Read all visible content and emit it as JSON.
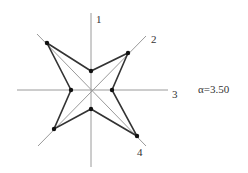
{
  "diagram": {
    "type": "star-radar",
    "axes": [
      {
        "id": "1",
        "label": "1"
      },
      {
        "id": "2",
        "label": "2"
      },
      {
        "id": "3",
        "label": "3"
      },
      {
        "id": "4",
        "label": "4"
      }
    ],
    "parameter": {
      "symbol": "α",
      "value": "3.50",
      "text": "α=3.50"
    },
    "colors": {
      "axis": "#9a9a9a",
      "outline": "#333333",
      "point": "#111111"
    },
    "center": [
      91,
      90
    ],
    "outer_points": [
      [
        47,
        43
      ],
      [
        128,
        53
      ],
      [
        137,
        136
      ],
      [
        54,
        129
      ]
    ],
    "inner_points": [
      [
        91,
        71
      ],
      [
        112,
        90
      ],
      [
        91,
        109
      ],
      [
        71,
        90
      ]
    ]
  }
}
